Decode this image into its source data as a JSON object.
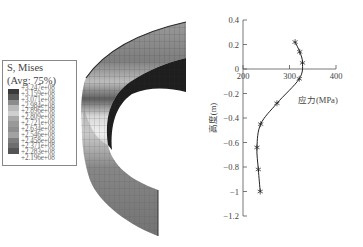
{
  "legend": {
    "title": "S, Mises",
    "subtitle": "(Avg: 75%)",
    "values": [
      "+3.247e+08",
      "+3.159e+08",
      "+3.071e+08",
      "+2.984e+08",
      "+2.896e+08",
      "+2.809e+08",
      "+2.721e+08",
      "+2.634e+08",
      "+2.546e+08",
      "+2.458e+08",
      "+2.371e+08",
      "+2.283e+08",
      "+2.196e+08"
    ],
    "colors": [
      "#3a3a3a",
      "#5a5a5a",
      "#8c8c8c",
      "#b9b9b9",
      "#cfcfcf",
      "#a9a9a9",
      "#999999",
      "#8e8e8e",
      "#a2a2a2",
      "#7d7d7d",
      "#6e6e6e",
      "#555555"
    ]
  },
  "model": {
    "description": "ABAQUS Mises stress contour of curved cylindrical shell segment (grayscale mesh)"
  },
  "chart_data": {
    "type": "line",
    "title": "",
    "xlabel": "应力(MPa)",
    "ylabel": "高度(m)",
    "xlim": [
      200,
      400
    ],
    "ylim": [
      -1.2,
      0.4
    ],
    "x_ticks": [
      "200",
      "300",
      "400"
    ],
    "y_ticks": [
      "0.4",
      "0.2",
      "0",
      "-0.2",
      "-0.4",
      "-0.6",
      "-0.8",
      "-1",
      "-1.2"
    ],
    "grid": false,
    "marker": "asterisk",
    "series": [
      {
        "name": "Mises stress vs height",
        "x": [
          312,
          322,
          328,
          321,
          273,
          238,
          230,
          233,
          237
        ],
        "y": [
          0.22,
          0.14,
          0.05,
          -0.08,
          -0.28,
          -0.45,
          -0.64,
          -0.82,
          -1.0
        ]
      }
    ]
  }
}
